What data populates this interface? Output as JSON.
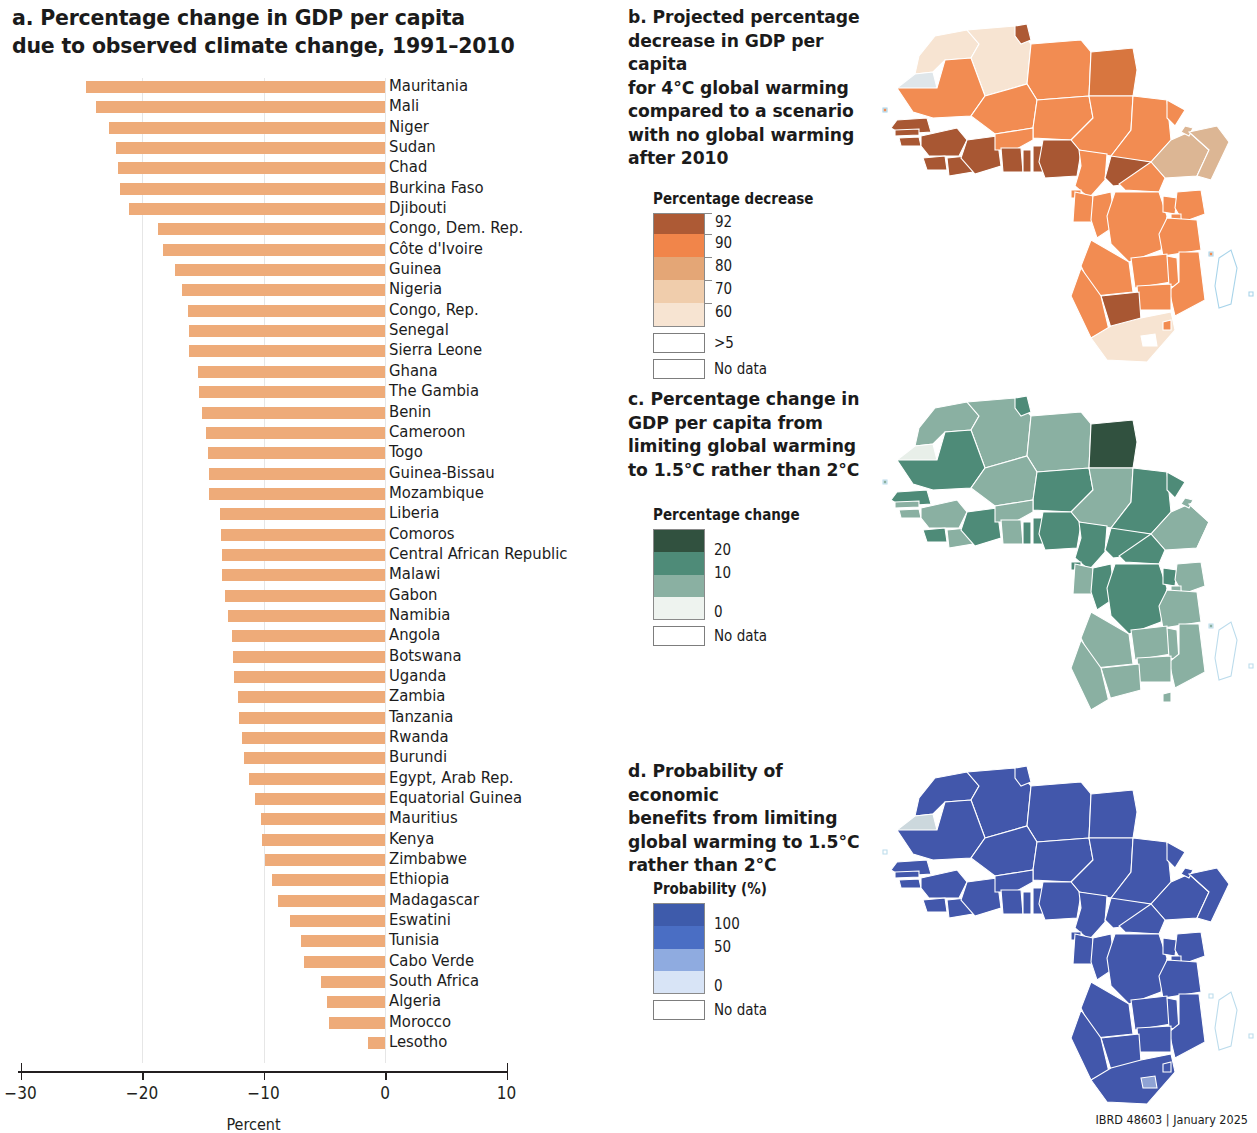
{
  "figure": {
    "credit": "IBRD 48603 | January 2025"
  },
  "panel_a": {
    "title": "a. Percentage change in GDP per capita due to observed climate change, 1991–2010",
    "title_line1": "a. Percentage change in GDP per capita",
    "title_line2": "due to observed climate change, 1991–2010",
    "axis_title": "Percent",
    "bar_color": "#eeab79"
  },
  "panel_b": {
    "title_lines": [
      "b. Projected percentage",
      "decrease in GDP per capita",
      "for 4°C global warming",
      "compared to a scenario",
      "with no global warming",
      "after 2010"
    ],
    "legend": {
      "title": "Percentage decrease",
      "ticks": [
        "92",
        "90",
        "80",
        "70",
        "60"
      ],
      "colors": [
        "#ad5a35",
        "#f1854a",
        "#e4a676",
        "#f0cdac",
        "#f7e4d2"
      ],
      "boxes": [
        {
          "label": ">5",
          "color": "#ffffff"
        },
        {
          "label": "No data",
          "color": "#ffffff"
        }
      ]
    }
  },
  "panel_c": {
    "title_lines": [
      "c. Percentage change in",
      "GDP per capita from",
      "limiting global warming",
      "to 1.5°C rather than 2°C"
    ],
    "legend": {
      "title": "Percentage change",
      "ticks": [
        "20",
        "10",
        "0"
      ],
      "colors": [
        "#31513f",
        "#4e8b78",
        "#8ab0a2",
        "#eef3ef"
      ],
      "boxes": [
        {
          "label": "No data",
          "color": "#ffffff"
        }
      ]
    }
  },
  "panel_d": {
    "title_lines": [
      "d. Probability of economic",
      "benefits from limiting",
      "global warming to 1.5°C",
      "rather than 2°C"
    ],
    "legend": {
      "title": "Probability (%)",
      "ticks": [
        "100",
        "50",
        "0"
      ],
      "colors": [
        "#3e5bab",
        "#4a6ec4",
        "#8fabe0",
        "#d8e4f6"
      ],
      "boxes": [
        {
          "label": "No data",
          "color": "#ffffff"
        }
      ]
    }
  },
  "chart_data": {
    "type": "bar",
    "title": "a. Percentage change in GDP per capita due to observed climate change, 1991–2010",
    "xlabel": "Percent",
    "ylabel": "",
    "xlim": [
      -30,
      10
    ],
    "xticks": [
      -30,
      -20,
      -10,
      0,
      10
    ],
    "xticklabels": [
      "−30",
      "−20",
      "−10",
      "0",
      "10"
    ],
    "grid": true,
    "orientation": "horizontal",
    "legend": null,
    "categories": [
      "Mauritania",
      "Mali",
      "Niger",
      "Sudan",
      "Chad",
      "Burkina Faso",
      "Djibouti",
      "Congo, Dem. Rep.",
      "Côte d'Ivoire",
      "Guinea",
      "Nigeria",
      "Congo, Rep.",
      "Senegal",
      "Sierra Leone",
      "Ghana",
      "The Gambia",
      "Benin",
      "Cameroon",
      "Togo",
      "Guinea-Bissau",
      "Mozambique",
      "Liberia",
      "Comoros",
      "Central African Republic",
      "Malawi",
      "Gabon",
      "Namibia",
      "Angola",
      "Botswana",
      "Uganda",
      "Zambia",
      "Tanzania",
      "Rwanda",
      "Burundi",
      "Egypt, Arab Rep.",
      "Equatorial Guinea",
      "Mauritius",
      "Kenya",
      "Zimbabwe",
      "Ethiopia",
      "Madagascar",
      "Eswatini",
      "Tunisia",
      "Cabo Verde",
      "South Africa",
      "Algeria",
      "Morocco",
      "Lesotho"
    ],
    "values": [
      -24.6,
      -23.8,
      -22.7,
      -22.1,
      -22.0,
      -21.8,
      -21.1,
      -18.7,
      -18.3,
      -17.3,
      -16.7,
      -16.2,
      -16.1,
      -16.1,
      -15.4,
      -15.3,
      -15.1,
      -14.7,
      -14.6,
      -14.5,
      -14.5,
      -13.6,
      -13.5,
      -13.4,
      -13.4,
      -13.2,
      -12.9,
      -12.6,
      -12.5,
      -12.4,
      -12.1,
      -12.0,
      -11.8,
      -11.6,
      -11.2,
      -10.7,
      -10.2,
      -10.1,
      -9.9,
      -9.3,
      -8.8,
      -7.8,
      -6.9,
      -6.7,
      -5.3,
      -4.8,
      -4.6,
      -1.4
    ]
  }
}
